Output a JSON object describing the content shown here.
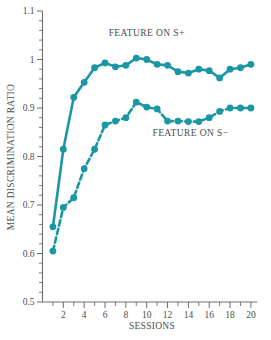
{
  "chart_data": {
    "type": "line",
    "title": "",
    "xlabel": "SESSIONS",
    "ylabel": "MEAN DISCRIMINATION RATIO",
    "x": [
      1,
      2,
      3,
      4,
      5,
      6,
      7,
      8,
      9,
      10,
      11,
      12,
      13,
      14,
      15,
      16,
      17,
      18,
      19,
      20
    ],
    "xlim": [
      0,
      20.8
    ],
    "ylim": [
      0.5,
      1.1
    ],
    "x_tick_labels": [
      "2",
      "4",
      "6",
      "8",
      "10",
      "12",
      "14",
      "16",
      "18",
      "20"
    ],
    "x_tick_values": [
      2,
      4,
      6,
      8,
      10,
      12,
      14,
      16,
      18,
      20
    ],
    "x_minor_tick_values": [
      1,
      3,
      5,
      7,
      9,
      11,
      13,
      15,
      17,
      19
    ],
    "y_tick_labels": [
      "0.5",
      "0.6",
      "0.7",
      "0.8",
      "0.9",
      "1",
      "1.1"
    ],
    "y_tick_values": [
      0.5,
      0.6,
      0.7,
      0.8,
      0.9,
      1.0,
      1.1
    ],
    "y_minor_tick_values": [
      0.52,
      0.54,
      0.56,
      0.58,
      0.62,
      0.64,
      0.66,
      0.68,
      0.72,
      0.74,
      0.76,
      0.78,
      0.82,
      0.84,
      0.86,
      0.88,
      0.92,
      0.94,
      0.96,
      0.98,
      1.02,
      1.04,
      1.06,
      1.08
    ],
    "grid": false,
    "legend_position": "inline-annotations",
    "series": [
      {
        "name": "FEATURE ON S+",
        "style": "solid",
        "color": "#1a96a5",
        "values": [
          0.655,
          0.815,
          0.922,
          0.953,
          0.983,
          0.993,
          0.985,
          0.988,
          1.003,
          1.0,
          0.99,
          0.988,
          0.975,
          0.972,
          0.98,
          0.977,
          0.962,
          0.98,
          0.983,
          0.99
        ],
        "label_x": 10.0,
        "label_y": 1.048
      },
      {
        "name": "FEATURE ON S−",
        "style": "dashed",
        "color": "#1a96a5",
        "values": [
          0.605,
          0.695,
          0.715,
          0.775,
          0.815,
          0.865,
          0.873,
          0.88,
          0.912,
          0.902,
          0.898,
          0.873,
          0.873,
          0.872,
          0.872,
          0.88,
          0.893,
          0.9,
          0.9,
          0.9
        ],
        "label_x": 14.2,
        "label_y": 0.843
      }
    ],
    "annotations": [
      {
        "text": "FEATURE ON S+",
        "x": 10.0,
        "y": 1.048
      },
      {
        "text": "FEATURE ON S−",
        "x": 14.2,
        "y": 0.843
      }
    ],
    "colors": {
      "series_teal": "#1a96a5",
      "axis_gray": "#6e6e6e",
      "text_gray": "#4d4d4d",
      "background": "#ffffff"
    }
  }
}
